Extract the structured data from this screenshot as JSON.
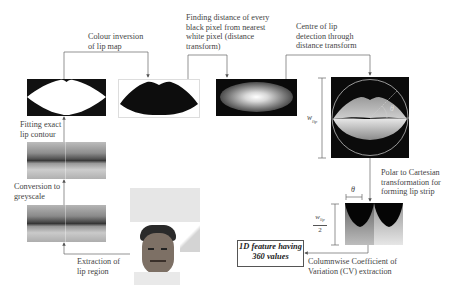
{
  "diagram": {
    "steps": {
      "extraction": "Extraction of lip region",
      "greyscale": "Conversion to greyscale",
      "contour": "Fitting exact lip contour",
      "inversion": "Colour inversion of lip map",
      "distance": "Finding distance of every black pixel from nearest white pixel (distance transform)",
      "centre": "Centre of lip detection through distance transform",
      "polar": "Polar to Cartesian transformation for forming lip strip",
      "cv": "Columnwise Coefficient of Variation (CV) extraction"
    },
    "label_lines": {
      "extraction": [
        "Extraction of",
        "lip region"
      ],
      "greyscale": [
        "Conversion to",
        "greyscale"
      ],
      "contour": [
        "Fitting exact",
        "lip contour"
      ],
      "inversion": [
        "Colour inversion",
        "of lip map"
      ],
      "distance": [
        "Finding distance of every",
        "black pixel from nearest",
        "white pixel (distance",
        "transform)"
      ],
      "centre": [
        "Centre of lip",
        "detection through",
        "distance transform"
      ],
      "polar": [
        "Polar to Cartesian",
        "transformation for",
        "forming lip strip"
      ],
      "cv": [
        "Columnwise Coefficient of",
        "Variation (CV) extraction"
      ]
    },
    "output": {
      "lines": [
        "1D feature having",
        "360 values"
      ]
    },
    "symbols": {
      "theta": "θ",
      "w_lip": "w",
      "w_lip_sub": "lip",
      "half_denominator": "2"
    },
    "images": [
      "face-photo",
      "colour-lip-crop",
      "greyscale-lip",
      "lip-contour-mask",
      "inverted-lip-map",
      "distance-transform-map",
      "lip-with-polar-circle",
      "lip-strip"
    ]
  }
}
